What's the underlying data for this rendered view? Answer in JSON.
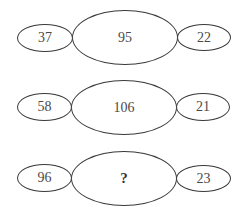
{
  "puzzle": {
    "rows": [
      {
        "left": "37",
        "center": "95",
        "right": "22"
      },
      {
        "left": "58",
        "center": "106",
        "right": "21"
      },
      {
        "left": "96",
        "center": "?",
        "right": "23"
      }
    ]
  },
  "colors": {
    "stroke": "#3a3a3a",
    "text": "#4a4a4a",
    "background": "#ffffff"
  }
}
